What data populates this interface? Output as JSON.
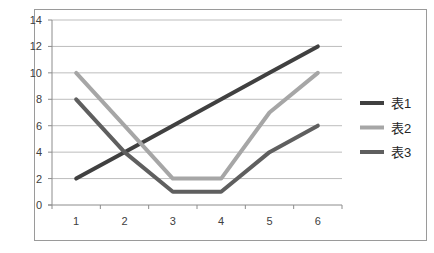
{
  "chart_data": {
    "type": "line",
    "title": "",
    "xlabel": "",
    "ylabel": "",
    "categories": [
      "1",
      "2",
      "3",
      "4",
      "5",
      "6"
    ],
    "series": [
      {
        "name": "表1",
        "values": [
          2,
          4,
          6,
          8,
          10,
          12
        ],
        "color": "#404040"
      },
      {
        "name": "表2",
        "values": [
          10,
          6,
          2,
          2,
          7,
          10
        ],
        "color": "#a6a6a6"
      },
      {
        "name": "表3",
        "values": [
          8,
          4,
          1,
          1,
          4,
          6
        ],
        "color": "#5f5f5f"
      }
    ],
    "ylim": [
      0,
      14
    ],
    "yticks": [
      "0",
      "2",
      "4",
      "6",
      "8",
      "10",
      "12",
      "14"
    ],
    "grid": true,
    "legend_position": "right"
  }
}
